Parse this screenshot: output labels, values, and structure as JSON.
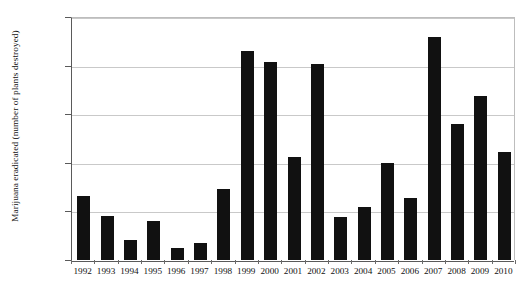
{
  "chart_data": {
    "type": "bar",
    "title": "",
    "xlabel": "",
    "ylabel": "Marijuana eradicated (number of plants destroyed)",
    "ylim": [
      0,
      2500000
    ],
    "ytick_labels": [
      "2,500,000",
      "2,000,000",
      "1,500,000",
      "1,000,000",
      "500,000",
      "0"
    ],
    "ytick_values": [
      2500000,
      2000000,
      1500000,
      1000000,
      500000,
      0
    ],
    "grid": "horizontal",
    "legend": "none",
    "bar_color": "#111111",
    "categories": [
      "1992",
      "1993",
      "1994",
      "1995",
      "1996",
      "1997",
      "1998",
      "1999",
      "2000",
      "2001",
      "2002",
      "2003",
      "2004",
      "2005",
      "2006",
      "2007",
      "2008",
      "2009",
      "2010"
    ],
    "values": [
      660000,
      450000,
      210000,
      400000,
      120000,
      180000,
      730000,
      2150000,
      2040000,
      1060000,
      2020000,
      440000,
      550000,
      1000000,
      640000,
      2290000,
      1400000,
      1690000,
      1110000
    ],
    "series": [
      {
        "name": "Marijuana eradicated",
        "values": [
          660000,
          450000,
          210000,
          400000,
          120000,
          180000,
          730000,
          2150000,
          2040000,
          1060000,
          2020000,
          440000,
          550000,
          1000000,
          640000,
          2290000,
          1400000,
          1690000,
          1110000
        ]
      }
    ]
  }
}
